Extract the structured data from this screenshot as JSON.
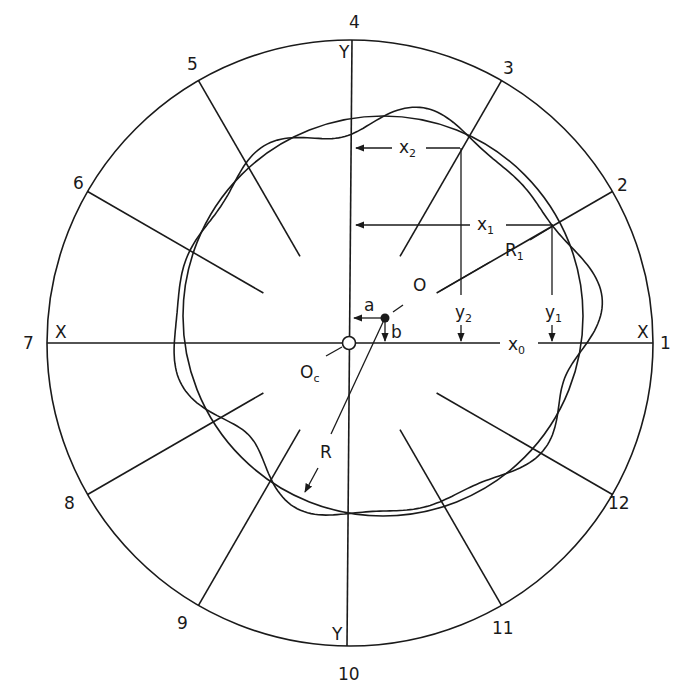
{
  "figure": {
    "type": "roundness measurement polar chart",
    "colors": {
      "ink": "#1a1a1a",
      "background": "#ffffff"
    },
    "outer_circle": {
      "cx": 350,
      "cy": 343,
      "r": 303
    },
    "chart_center": {
      "cx": 348,
      "cy": 343,
      "label": "O",
      "subscript": "c"
    },
    "profile_center": {
      "cx": 384,
      "cy": 318,
      "label": "O"
    },
    "reference_circle": {
      "cx": 383,
      "cy": 316,
      "r": 200
    },
    "radial_divisions": [
      {
        "label": "1",
        "angle_deg": 0
      },
      {
        "label": "2",
        "angle_deg": 30
      },
      {
        "label": "3",
        "angle_deg": 60
      },
      {
        "label": "4",
        "angle_deg": 90
      },
      {
        "label": "5",
        "angle_deg": 120
      },
      {
        "label": "6",
        "angle_deg": 150
      },
      {
        "label": "7",
        "angle_deg": 180
      },
      {
        "label": "8",
        "angle_deg": 210
      },
      {
        "label": "9",
        "angle_deg": 240
      },
      {
        "label": "10",
        "angle_deg": 270
      },
      {
        "label": "11",
        "angle_deg": 300
      },
      {
        "label": "12",
        "angle_deg": 330
      }
    ],
    "axis_labels": {
      "x_left": "X",
      "x_right": "X",
      "y_top": "Y",
      "y_bottom": "Y"
    },
    "annotations": {
      "x0": {
        "main": "x",
        "sub": "0"
      },
      "x1": {
        "main": "x",
        "sub": "1"
      },
      "x2": {
        "main": "x",
        "sub": "2"
      },
      "y1": {
        "main": "y",
        "sub": "1"
      },
      "y2": {
        "main": "y",
        "sub": "2"
      },
      "R1": {
        "main": "R",
        "sub": "1"
      },
      "R": "R",
      "a": "a",
      "b": "b",
      "O": "O",
      "Oc": {
        "main": "O",
        "sub": "c"
      }
    }
  }
}
